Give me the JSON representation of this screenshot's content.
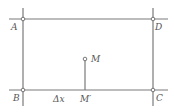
{
  "diagram": {
    "type": "geometry",
    "colors": {
      "line": "#7a7a7a",
      "label": "#555555",
      "background": "#ffffff"
    },
    "points": [
      {
        "id": "A",
        "label": "A",
        "x": 23,
        "y": 19
      },
      {
        "id": "D",
        "label": "D",
        "x": 153,
        "y": 19
      },
      {
        "id": "B",
        "label": "B",
        "x": 23,
        "y": 90
      },
      {
        "id": "C",
        "label": "C",
        "x": 153,
        "y": 90
      },
      {
        "id": "M",
        "label": "M",
        "x": 85,
        "y": 59
      },
      {
        "id": "Mp",
        "label": "M′",
        "x": 85,
        "y": 90
      }
    ],
    "segments": [
      {
        "from": "A",
        "to": "D",
        "label": ""
      },
      {
        "from": "B",
        "to": "C",
        "label": ""
      },
      {
        "from": "A",
        "to": "B",
        "label": ""
      },
      {
        "from": "D",
        "to": "C",
        "label": ""
      },
      {
        "from": "M",
        "to": "Mp",
        "label": ""
      }
    ],
    "annotations": [
      {
        "id": "delta-x",
        "text": "Δx",
        "x": 50,
        "y": 102
      }
    ]
  }
}
